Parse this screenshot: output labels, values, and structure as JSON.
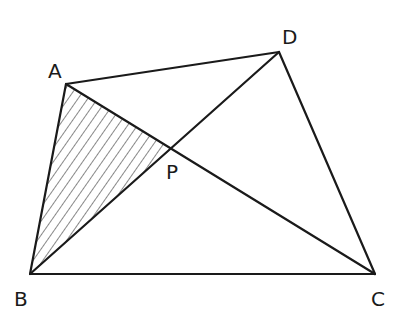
{
  "diagram": {
    "type": "quadrilateral-with-diagonals",
    "points": {
      "A": {
        "x": 66,
        "y": 84
      },
      "B": {
        "x": 30,
        "y": 274
      },
      "C": {
        "x": 375,
        "y": 274
      },
      "D": {
        "x": 279,
        "y": 52
      },
      "P": {
        "x": 171,
        "y": 149
      }
    },
    "labels": [
      {
        "id": "A",
        "text": "A",
        "x": 48,
        "y": 78
      },
      {
        "id": "D",
        "text": "D",
        "x": 282,
        "y": 44
      },
      {
        "id": "P",
        "text": "P",
        "x": 166,
        "y": 179
      },
      {
        "id": "B",
        "text": "B",
        "x": 14,
        "y": 306
      },
      {
        "id": "C",
        "text": "C",
        "x": 371,
        "y": 306
      }
    ],
    "segments": [
      {
        "from": "A",
        "to": "D"
      },
      {
        "from": "D",
        "to": "C"
      },
      {
        "from": "B",
        "to": "C"
      },
      {
        "from": "A",
        "to": "B"
      },
      {
        "from": "A",
        "to": "C"
      },
      {
        "from": "B",
        "to": "D"
      }
    ],
    "shaded_region": {
      "vertices": [
        "A",
        "B",
        "P"
      ],
      "pattern": "diagonal-hatch"
    },
    "colors": {
      "stroke": "#1a1a1a",
      "hatch": "#555555",
      "background": "#ffffff"
    }
  }
}
